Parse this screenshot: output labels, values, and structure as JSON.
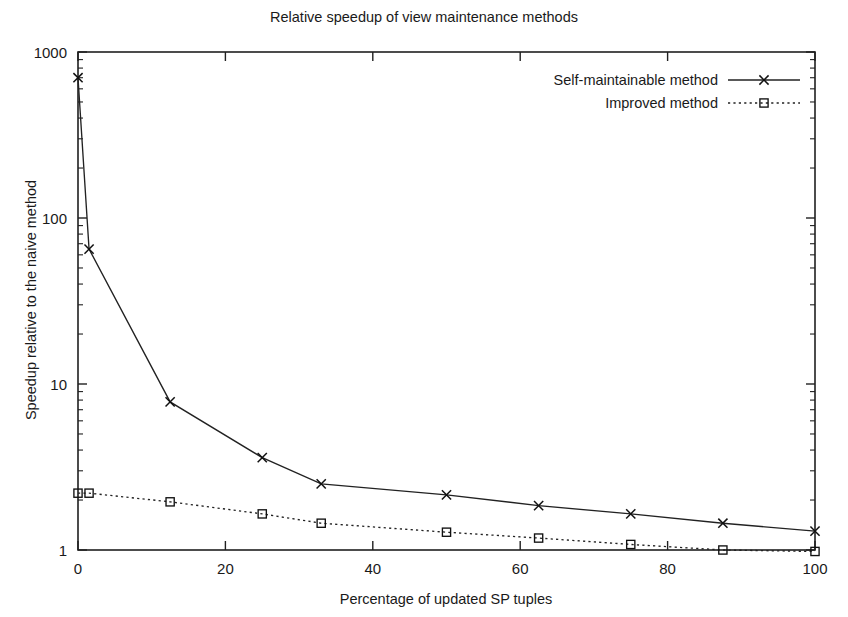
{
  "chart_data": {
    "type": "line",
    "title": "Relative speedup of view maintenance methods",
    "xlabel": "Percentage of updated SP tuples",
    "ylabel": "Speedup relative to the naive method",
    "xlim": [
      0,
      100
    ],
    "ylim": [
      1,
      1000
    ],
    "yscale": "log",
    "xscale": "linear",
    "grid": false,
    "legend_position": "top-right inside plot",
    "xticks": [
      0,
      20,
      40,
      60,
      80,
      100
    ],
    "xticklabels": [
      "0",
      "20",
      "40",
      "60",
      "80",
      "100"
    ],
    "yticks": [
      1,
      10,
      100,
      1000
    ],
    "yticklabels": [
      "1",
      "10",
      "100",
      "1000"
    ],
    "series": [
      {
        "name": "Self-maintainable method",
        "marker": "x",
        "linestyle": "solid",
        "color": "#222222",
        "x": [
          0,
          1.5,
          12.5,
          25,
          33,
          50,
          62.5,
          75,
          87.5,
          100
        ],
        "values": [
          700,
          65,
          7.8,
          3.6,
          2.5,
          2.15,
          1.85,
          1.65,
          1.45,
          1.3
        ]
      },
      {
        "name": "Improved method",
        "marker": "square",
        "linestyle": "dotted",
        "color": "#222222",
        "x": [
          0,
          1.5,
          12.5,
          25,
          33,
          50,
          62.5,
          75,
          87.5,
          100
        ],
        "values": [
          2.2,
          2.2,
          1.95,
          1.65,
          1.45,
          1.28,
          1.18,
          1.08,
          1.0,
          0.98
        ]
      }
    ]
  },
  "legend": {
    "entries": [
      {
        "label": "Self-maintainable method"
      },
      {
        "label": "Improved method"
      }
    ]
  }
}
